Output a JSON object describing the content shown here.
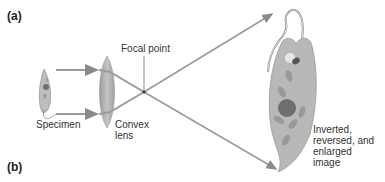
{
  "panels": {
    "a": "(a)",
    "b": "(b)"
  },
  "labels": {
    "focal_point": "Focal point",
    "specimen": "Specimen",
    "lens_line1": "Convex",
    "lens_line2": "lens",
    "image_line1": "Inverted,",
    "image_line2": "reversed, and",
    "image_line3": "enlarged",
    "image_line4": "image"
  },
  "colors": {
    "ray": "#9a9a9a",
    "lens": "#a8a8a8",
    "organism_body": "#b8b8b8",
    "nucleus": "#6e6e6e",
    "organelle": "#999999",
    "text": "#333333"
  }
}
